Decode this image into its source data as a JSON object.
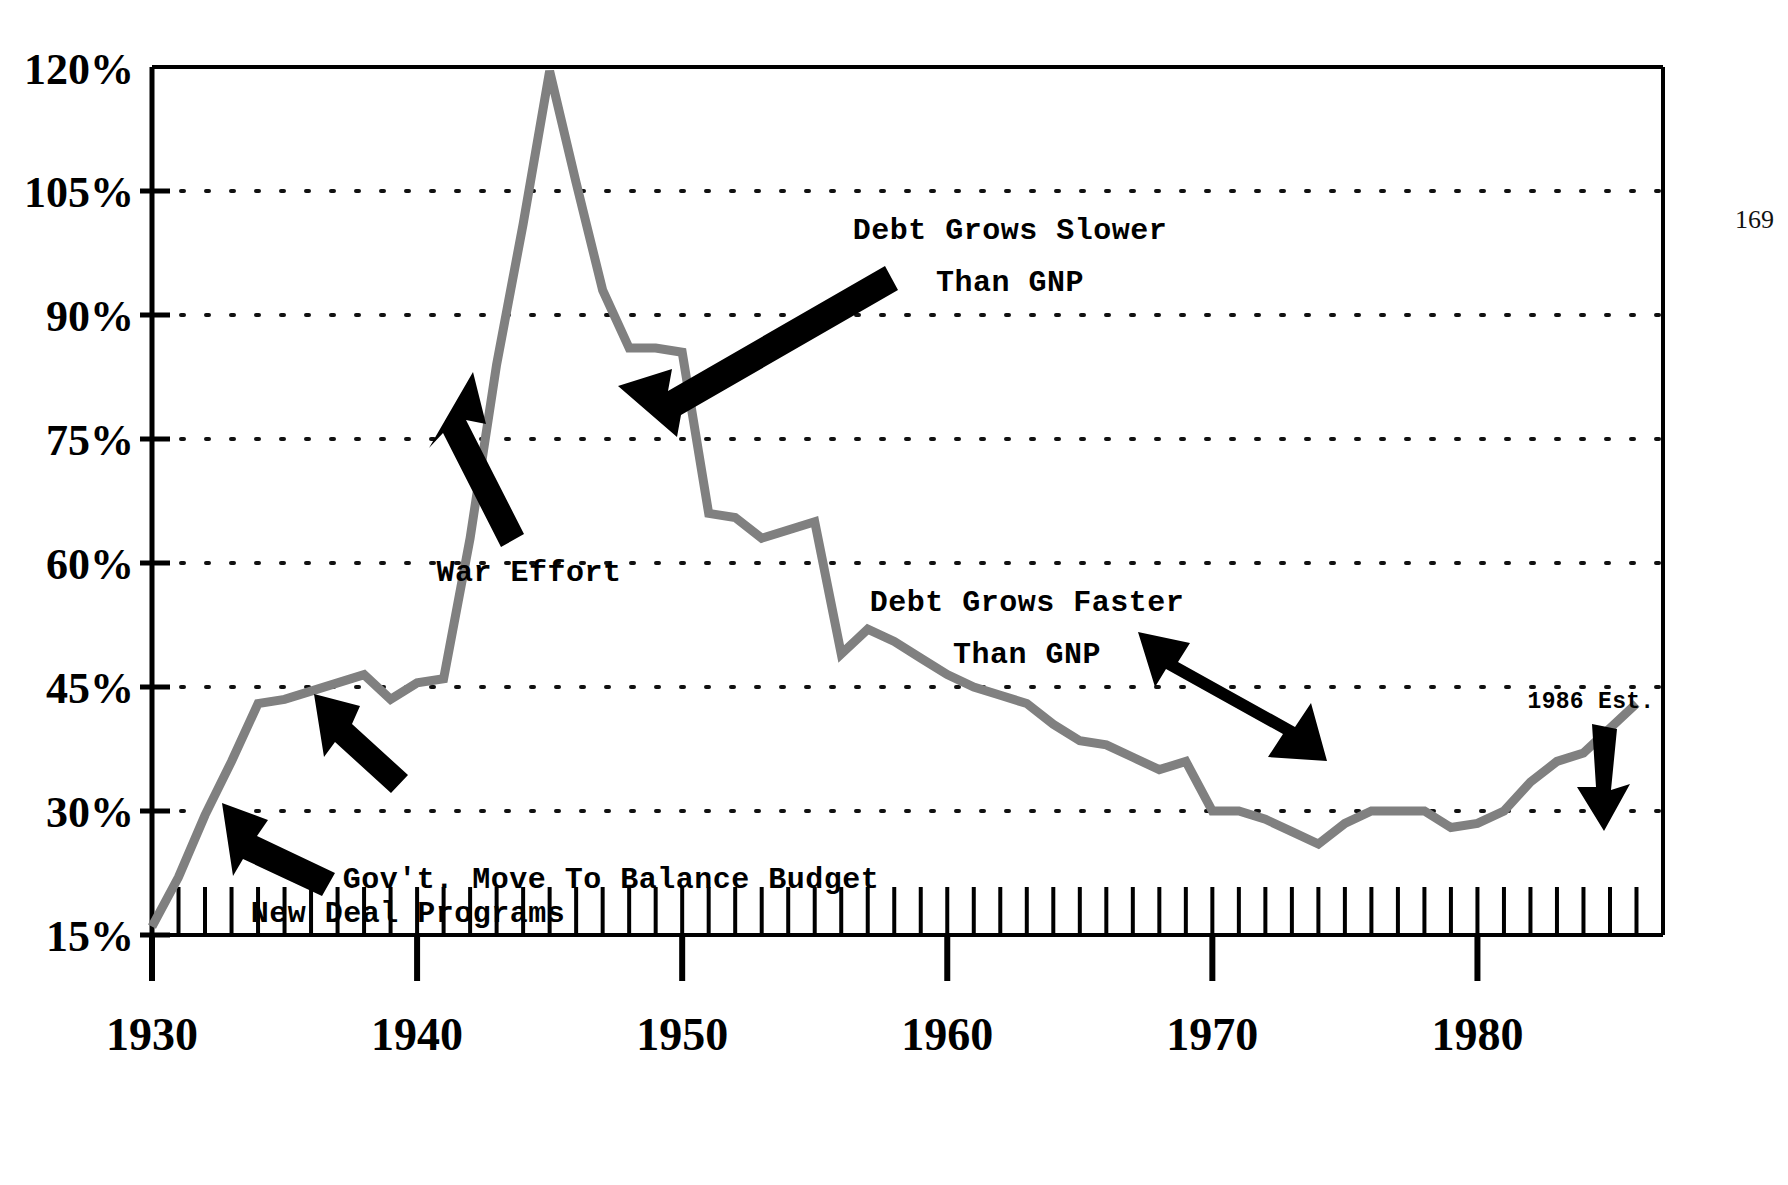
{
  "page": {
    "folio": "169"
  },
  "chart_data": {
    "type": "line",
    "title": "",
    "subtitle": "",
    "xlabel": "",
    "ylabel": "",
    "xlim": [
      1930,
      1987
    ],
    "ylim": [
      15,
      120
    ],
    "grid": "horizontal-dotted",
    "legend": "none",
    "line_color": "#808080",
    "axis_color": "#000000",
    "y_ticks": [
      15,
      30,
      45,
      60,
      75,
      90,
      105,
      120
    ],
    "y_ticklabels": [
      "15%",
      "30%",
      "45%",
      "60%",
      "75%",
      "90%",
      "105%",
      "120%"
    ],
    "x_ticks": [
      1930,
      1940,
      1950,
      1960,
      1970,
      1980
    ],
    "x_ticklabels": [
      "1930",
      "1940",
      "1950",
      "1960",
      "1970",
      "1980"
    ],
    "x_minor_tick_step": 1,
    "series": [
      {
        "name": "Federal Debt as Percent of GNP",
        "x": [
          1930,
          1931,
          1932,
          1933,
          1934,
          1935,
          1936,
          1937,
          1938,
          1939,
          1940,
          1941,
          1942,
          1943,
          1944,
          1945,
          1946,
          1947,
          1948,
          1949,
          1950,
          1951,
          1952,
          1953,
          1954,
          1955,
          1956,
          1957,
          1958,
          1959,
          1960,
          1961,
          1962,
          1963,
          1964,
          1965,
          1966,
          1967,
          1968,
          1969,
          1970,
          1971,
          1972,
          1973,
          1974,
          1975,
          1976,
          1977,
          1978,
          1979,
          1980,
          1981,
          1982,
          1983,
          1984,
          1985,
          1986
        ],
        "values": [
          16.0,
          22.0,
          29.5,
          36.0,
          43.0,
          43.5,
          44.5,
          45.5,
          46.5,
          43.5,
          45.5,
          46.0,
          63.0,
          84.0,
          101.0,
          119.5,
          106.0,
          93.0,
          86.0,
          86.0,
          85.5,
          66.0,
          65.5,
          63.0,
          64.0,
          65.0,
          49.0,
          52.0,
          50.5,
          48.5,
          46.5,
          45.0,
          44.0,
          43.0,
          40.5,
          38.5,
          38.0,
          36.5,
          35.0,
          36.0,
          30.0,
          30.0,
          29.0,
          27.5,
          26.0,
          28.5,
          30.0,
          30.0,
          30.0,
          28.0,
          28.5,
          30.0,
          33.5,
          36.0,
          37.0,
          40.0,
          43.0
        ]
      }
    ],
    "annotations": [
      {
        "id": "war-effort",
        "label": "War Effort",
        "lines": [
          "War Effort"
        ]
      },
      {
        "id": "new-deal",
        "label": "New Deal Programs",
        "lines": [
          "New Deal Programs"
        ]
      },
      {
        "id": "balance-budget",
        "label": "Gov't. Move To Balance Budget",
        "lines": [
          "Gov't. Move To Balance Budget"
        ]
      },
      {
        "id": "debt-slower",
        "label": "Debt Grows Slower Than GNP",
        "lines": [
          "Debt Grows Slower",
          "Than GNP"
        ]
      },
      {
        "id": "debt-faster",
        "label": "Debt Grows Faster Than GNP",
        "lines": [
          "Debt Grows Faster",
          "Than GNP"
        ]
      },
      {
        "id": "est-1986",
        "label": "1986 Est.",
        "lines": [
          "1986 Est."
        ]
      }
    ]
  },
  "annotation_text": {
    "war_effort": "War Effort",
    "new_deal": "New Deal Programs",
    "balance_budget": "Gov't. Move To Balance Budget",
    "debt_slower_1": "Debt Grows Slower",
    "debt_slower_2": "Than GNP",
    "debt_faster_1": "Debt Grows Faster",
    "debt_faster_2": "Than GNP",
    "est_1986": "1986 Est."
  },
  "axis": {
    "y_labels": [
      "120%",
      "105%",
      "90%",
      "75%",
      "60%",
      "45%",
      "30%",
      "15%"
    ],
    "x_labels": [
      "1930",
      "1940",
      "1950",
      "1960",
      "1970",
      "1980"
    ]
  },
  "colors": {
    "line": "#808080",
    "axis": "#000000",
    "grid": "#1a1a1a",
    "annotation": "#000000",
    "background": "#ffffff"
  }
}
